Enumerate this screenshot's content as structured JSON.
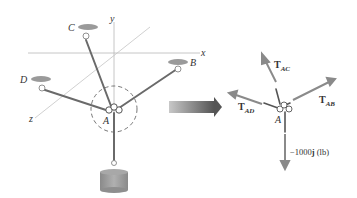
{
  "left_figure": {
    "axes": {
      "x": "x",
      "y": "y",
      "z": "z"
    },
    "points": {
      "A": "A",
      "B": "B",
      "C": "C",
      "D": "D"
    }
  },
  "transition_arrow": {
    "icon": "right-arrow-icon"
  },
  "free_body_diagram": {
    "forces": [
      {
        "name": "T",
        "sub": "AC"
      },
      {
        "name": "T",
        "sub": "AB"
      },
      {
        "name": "T",
        "sub": "AD"
      }
    ],
    "point": "A",
    "load_label": "−1000",
    "load_unit_vector": "j",
    "load_unit": " (lb)"
  },
  "colors": {
    "axis": "#b0b0b0",
    "rod": "#6a6a6a",
    "force_arrow": "#8a8a8a",
    "anchor": "#9a9a9a",
    "weight": "#9c9c9c"
  }
}
